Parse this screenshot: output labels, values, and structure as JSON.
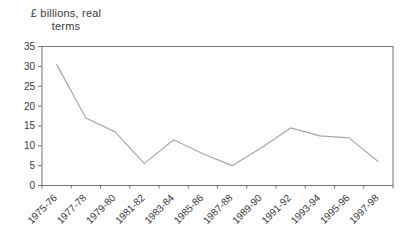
{
  "title": {
    "line1": "£ billions, real",
    "line2": "terms"
  },
  "chart_data": {
    "type": "line",
    "title": "£ billions, real terms",
    "categories": [
      "1975-76",
      "1977-78",
      "1979-80",
      "1981-82",
      "1983-84",
      "1985-86",
      "1987-88",
      "1989-90",
      "1991-92",
      "1993-94",
      "1995-96",
      "1997-98"
    ],
    "values": [
      30.5,
      17,
      13.5,
      5.5,
      11.5,
      8,
      5,
      9.5,
      14.5,
      12.5,
      12,
      6
    ],
    "xlabel": "",
    "ylabel": "£ billions, real terms",
    "ylim": [
      0,
      35
    ],
    "yticks": [
      0,
      5,
      10,
      15,
      20,
      25,
      30,
      35
    ],
    "grid": false,
    "legend": "none",
    "colors": {
      "line": "#a8a8a8",
      "axis": "#757575",
      "label": "#3b3b3b"
    },
    "font_px": {
      "tick_label": 10
    }
  }
}
